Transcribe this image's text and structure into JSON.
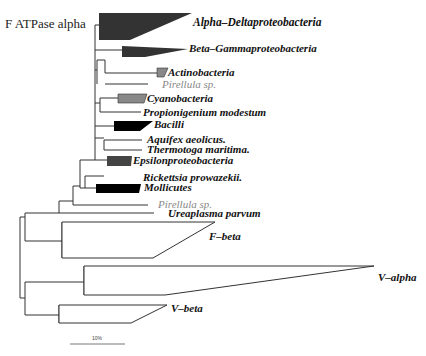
{
  "title": "F ATPase alpha",
  "colors": {
    "dark_clade": "#333333",
    "black_clade": "#000000",
    "grey_clade": "#888888",
    "branch": "#333333",
    "grey_text": "#888888"
  },
  "taxa": [
    {
      "label": "Alpha–Deltaproteobacteria",
      "type": "clade",
      "fill": "dark"
    },
    {
      "label": "Beta–Gammaproteobacteria",
      "type": "clade",
      "fill": "dark"
    },
    {
      "label": "Actinobacteria",
      "type": "clade",
      "fill": "grey"
    },
    {
      "label": "Pirellula sp.",
      "type": "leaf",
      "style": "grey"
    },
    {
      "label": "Cyanobacteria",
      "type": "clade",
      "fill": "grey"
    },
    {
      "label": "Propionigenium modestum",
      "type": "leaf",
      "style": "bold"
    },
    {
      "label": "Bacilli",
      "type": "clade",
      "fill": "black"
    },
    {
      "label": "Aquifex aeolicus.",
      "type": "leaf",
      "style": "bold"
    },
    {
      "label": "Thermotoga maritima.",
      "type": "leaf",
      "style": "bold"
    },
    {
      "label": "Epsilonproteobacteria",
      "type": "clade",
      "fill": "dark"
    },
    {
      "label": "Rickettsia prowazekii.",
      "type": "leaf",
      "style": "bold"
    },
    {
      "label": "Mollicutes",
      "type": "clade",
      "fill": "black"
    },
    {
      "label": "Pirellula sp.",
      "type": "leaf",
      "style": "grey"
    },
    {
      "label": "Ureaplasma parvum",
      "type": "leaf",
      "style": "bold"
    },
    {
      "label": "F–beta",
      "type": "clade",
      "fill": "none"
    },
    {
      "label": "V–alpha",
      "type": "clade",
      "fill": "none"
    },
    {
      "label": "V–beta",
      "type": "clade",
      "fill": "none"
    }
  ],
  "scale_bar": {
    "label": "10%"
  }
}
